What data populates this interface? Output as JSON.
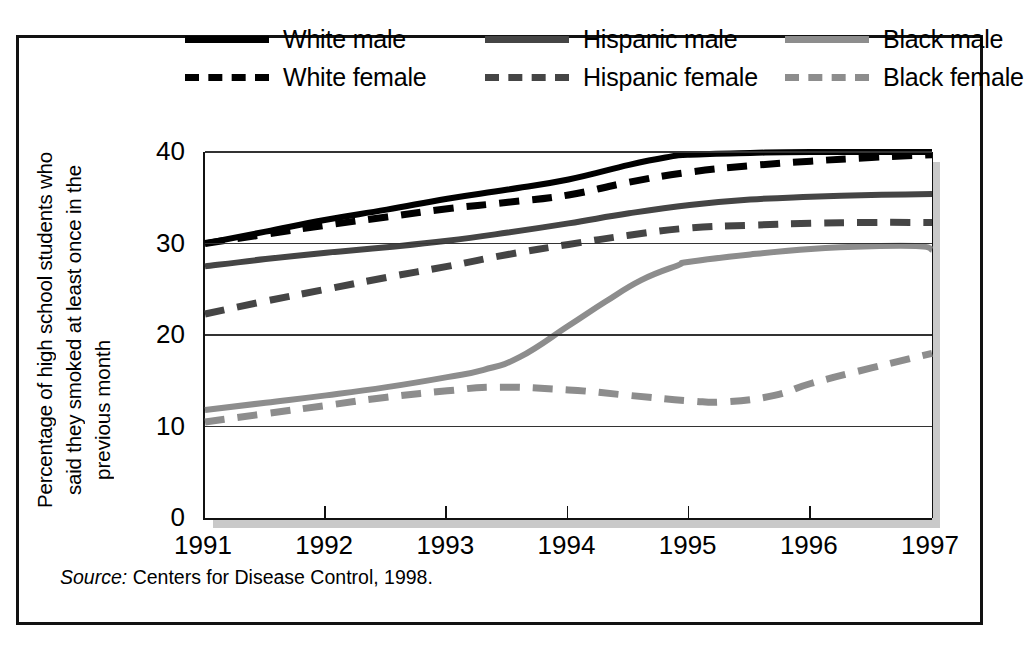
{
  "figure": {
    "source_label": "Source:",
    "source_text": "Centers for Disease Control, 1998."
  },
  "colors": {
    "white_series": "#000000",
    "hispanic_series": "#454545",
    "black_series": "#8d8d8d",
    "frame": "#111111",
    "gridline": "#333333",
    "shadow": "#c9c9c9",
    "background": "#ffffff"
  },
  "legend": {
    "position": "top",
    "rows": [
      [
        {
          "label": "White male",
          "style": "solid",
          "color": "#000000"
        },
        {
          "label": "Hispanic male",
          "style": "solid",
          "color": "#454545"
        },
        {
          "label": "Black male",
          "style": "solid",
          "color": "#8d8d8d"
        }
      ],
      [
        {
          "label": "White female",
          "style": "dashed",
          "color": "#000000"
        },
        {
          "label": "Hispanic female",
          "style": "dashed",
          "color": "#454545"
        },
        {
          "label": "Black female",
          "style": "dashed",
          "color": "#8d8d8d"
        }
      ]
    ]
  },
  "axes": {
    "ylabel_line1": "Percentage of high school students who",
    "ylabel_line2": "said they smoked at least once in the",
    "ylabel_line3": "previous month",
    "yticks": [
      "40",
      "30",
      "20",
      "10",
      "0"
    ],
    "xticks": [
      "1991",
      "1992",
      "1993",
      "1994",
      "1995",
      "1996",
      "1997"
    ]
  },
  "chart_data": {
    "type": "line",
    "title": "",
    "subtitle": "",
    "xlabel": "",
    "ylabel": "Percentage of high school students who said they smoked at least once in the previous month",
    "x": [
      1991,
      1992,
      1993,
      1994,
      1995,
      1996,
      1997
    ],
    "xlim": [
      1991,
      1997
    ],
    "ylim": [
      0,
      40
    ],
    "yticks": [
      0,
      10,
      20,
      30,
      40
    ],
    "grid": "horizontal",
    "legend_position": "top",
    "annotations": [
      "Source: Centers for Disease Control, 1998."
    ],
    "series": [
      {
        "name": "White male",
        "style": "solid",
        "color": "#000000",
        "values": [
          30.0,
          32.6,
          34.9,
          37.0,
          39.6,
          40.0,
          40.0
        ],
        "points": [
          {
            "x": 1991.0,
            "y": 30.0
          },
          {
            "x": 1991.5,
            "y": 31.3
          },
          {
            "x": 1992.0,
            "y": 32.6
          },
          {
            "x": 1992.5,
            "y": 33.7
          },
          {
            "x": 1993.0,
            "y": 34.9
          },
          {
            "x": 1993.5,
            "y": 35.9
          },
          {
            "x": 1994.0,
            "y": 37.0
          },
          {
            "x": 1994.5,
            "y": 38.6
          },
          {
            "x": 1994.8,
            "y": 39.4
          },
          {
            "x": 1995.0,
            "y": 39.7
          },
          {
            "x": 1995.5,
            "y": 39.9
          },
          {
            "x": 1996.0,
            "y": 40.0
          },
          {
            "x": 1997.0,
            "y": 40.0
          }
        ]
      },
      {
        "name": "White female",
        "style": "dashed",
        "color": "#000000",
        "values": [
          30.0,
          32.0,
          33.8,
          35.3,
          37.8,
          39.0,
          39.7
        ],
        "points": [
          {
            "x": 1991.0,
            "y": 30.0
          },
          {
            "x": 1991.5,
            "y": 31.0
          },
          {
            "x": 1992.0,
            "y": 32.0
          },
          {
            "x": 1992.5,
            "y": 32.9
          },
          {
            "x": 1993.0,
            "y": 33.8
          },
          {
            "x": 1993.5,
            "y": 34.5
          },
          {
            "x": 1994.0,
            "y": 35.3
          },
          {
            "x": 1994.5,
            "y": 36.7
          },
          {
            "x": 1995.0,
            "y": 37.8
          },
          {
            "x": 1995.5,
            "y": 38.5
          },
          {
            "x": 1996.0,
            "y": 39.0
          },
          {
            "x": 1996.5,
            "y": 39.4
          },
          {
            "x": 1997.0,
            "y": 39.7
          }
        ]
      },
      {
        "name": "Hispanic male",
        "style": "solid",
        "color": "#454545",
        "values": [
          27.5,
          29.0,
          30.3,
          32.2,
          34.2,
          35.1,
          35.4
        ],
        "points": [
          {
            "x": 1991.0,
            "y": 27.5
          },
          {
            "x": 1991.5,
            "y": 28.3
          },
          {
            "x": 1992.0,
            "y": 29.0
          },
          {
            "x": 1992.5,
            "y": 29.6
          },
          {
            "x": 1993.0,
            "y": 30.3
          },
          {
            "x": 1993.5,
            "y": 31.2
          },
          {
            "x": 1994.0,
            "y": 32.2
          },
          {
            "x": 1994.5,
            "y": 33.3
          },
          {
            "x": 1995.0,
            "y": 34.2
          },
          {
            "x": 1995.5,
            "y": 34.8
          },
          {
            "x": 1996.0,
            "y": 35.1
          },
          {
            "x": 1996.5,
            "y": 35.3
          },
          {
            "x": 1997.0,
            "y": 35.4
          }
        ]
      },
      {
        "name": "Hispanic female",
        "style": "dashed",
        "color": "#454545",
        "values": [
          22.3,
          25.0,
          27.5,
          29.9,
          31.7,
          32.2,
          32.3
        ],
        "points": [
          {
            "x": 1991.0,
            "y": 22.3
          },
          {
            "x": 1991.5,
            "y": 23.7
          },
          {
            "x": 1992.0,
            "y": 25.0
          },
          {
            "x": 1992.5,
            "y": 26.3
          },
          {
            "x": 1993.0,
            "y": 27.5
          },
          {
            "x": 1993.5,
            "y": 28.8
          },
          {
            "x": 1994.0,
            "y": 29.9
          },
          {
            "x": 1994.5,
            "y": 30.9
          },
          {
            "x": 1995.0,
            "y": 31.7
          },
          {
            "x": 1995.5,
            "y": 32.0
          },
          {
            "x": 1996.0,
            "y": 32.2
          },
          {
            "x": 1996.5,
            "y": 32.3
          },
          {
            "x": 1997.0,
            "y": 32.3
          }
        ]
      },
      {
        "name": "Black male",
        "style": "solid",
        "color": "#8d8d8d",
        "values": [
          11.8,
          13.4,
          15.4,
          21.0,
          28.0,
          29.7,
          29.3
        ],
        "points": [
          {
            "x": 1991.0,
            "y": 11.8
          },
          {
            "x": 1991.5,
            "y": 12.6
          },
          {
            "x": 1992.0,
            "y": 13.4
          },
          {
            "x": 1992.5,
            "y": 14.3
          },
          {
            "x": 1993.0,
            "y": 15.4
          },
          {
            "x": 1993.3,
            "y": 16.2
          },
          {
            "x": 1993.6,
            "y": 17.6
          },
          {
            "x": 1994.0,
            "y": 21.0
          },
          {
            "x": 1994.3,
            "y": 23.6
          },
          {
            "x": 1994.6,
            "y": 26.0
          },
          {
            "x": 1994.9,
            "y": 27.6
          },
          {
            "x": 1995.0,
            "y": 28.0
          },
          {
            "x": 1995.5,
            "y": 28.8
          },
          {
            "x": 1996.0,
            "y": 29.4
          },
          {
            "x": 1996.5,
            "y": 29.7
          },
          {
            "x": 1996.9,
            "y": 29.7
          },
          {
            "x": 1997.0,
            "y": 29.3
          }
        ]
      },
      {
        "name": "Black female",
        "style": "dashed",
        "color": "#8d8d8d",
        "values": [
          10.5,
          12.3,
          13.9,
          14.0,
          12.8,
          14.7,
          18.0
        ],
        "points": [
          {
            "x": 1991.0,
            "y": 10.5
          },
          {
            "x": 1991.5,
            "y": 11.4
          },
          {
            "x": 1992.0,
            "y": 12.3
          },
          {
            "x": 1992.5,
            "y": 13.2
          },
          {
            "x": 1993.0,
            "y": 13.9
          },
          {
            "x": 1993.4,
            "y": 14.3
          },
          {
            "x": 1994.0,
            "y": 14.0
          },
          {
            "x": 1994.5,
            "y": 13.4
          },
          {
            "x": 1995.0,
            "y": 12.8
          },
          {
            "x": 1995.3,
            "y": 12.7
          },
          {
            "x": 1995.7,
            "y": 13.4
          },
          {
            "x": 1996.0,
            "y": 14.7
          },
          {
            "x": 1996.5,
            "y": 16.4
          },
          {
            "x": 1997.0,
            "y": 18.0
          }
        ]
      }
    ]
  }
}
